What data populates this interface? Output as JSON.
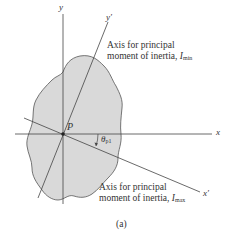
{
  "figure": {
    "label": "(a)",
    "point_label": "P",
    "angle_label": "θ",
    "angle_subscript": "p1",
    "axes": {
      "x": "x",
      "y": "y",
      "x_prime": "x′",
      "y_prime": "y′"
    },
    "annotations": {
      "min": {
        "line1": "Axis for principal",
        "line2": "moment of inertia, ",
        "symbol": "I",
        "subscript": "min"
      },
      "max": {
        "line1": "Axis for principal",
        "line2": "moment of inertia, ",
        "symbol": "I",
        "subscript": "max"
      }
    },
    "colors": {
      "area_fill": "#d9d9d9",
      "line": "#444444",
      "text": "#333333"
    }
  }
}
